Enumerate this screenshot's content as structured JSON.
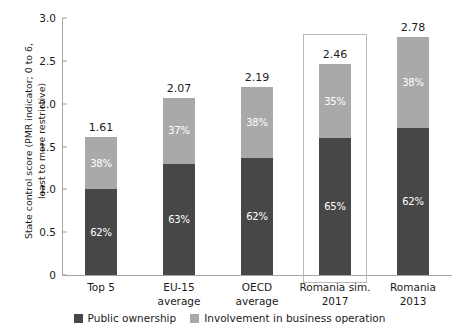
{
  "chart_data": {
    "type": "bar",
    "title": "",
    "subtitle": "",
    "stacked": true,
    "xlabel": "",
    "ylabel": "State control score (PMR indicator; 0 to 6,\nleast to more restrictive)",
    "ylim": [
      0,
      3.0
    ],
    "yticks": [
      "0",
      "0.5",
      "1.0",
      "1.5",
      "2.0",
      "2.5",
      "3.0"
    ],
    "ytick_values": [
      0,
      0.5,
      1.0,
      1.5,
      2.0,
      2.5,
      3.0
    ],
    "grid": false,
    "legend_position": "bottom",
    "categories": [
      "Top 5",
      "EU-15\naverage",
      "OECD\naverage",
      "Romania sim.\n2017",
      "Romania\n2013"
    ],
    "series": [
      {
        "name": "Public ownership",
        "color": "#474747",
        "values": [
          1.0,
          1.3,
          1.36,
          1.6,
          1.72
        ],
        "labels": [
          "62%",
          "63%",
          "62%",
          "65%",
          "62%"
        ]
      },
      {
        "name": "Involvement in business operation",
        "color": "#a9a9a9",
        "values": [
          0.61,
          0.77,
          0.83,
          0.86,
          1.06
        ],
        "labels": [
          "38%",
          "37%",
          "38%",
          "35%",
          "38%"
        ]
      }
    ],
    "totals": [
      "1.61",
      "2.07",
      "2.19",
      "2.46",
      "2.78"
    ],
    "total_values": [
      1.61,
      2.07,
      2.19,
      2.46,
      2.78
    ],
    "highlighted_category": "Romania sim.\n2017",
    "annotations": []
  },
  "legend": {
    "items": [
      {
        "label": "Public ownership",
        "color": "#474747"
      },
      {
        "label": "Involvement in business operation",
        "color": "#a9a9a9"
      }
    ]
  },
  "axis": {
    "y_title": "State control score (PMR indicator; 0 to 6,\nleast to more restrictive)",
    "y_ticks": [
      "3.0",
      "2.5",
      "2.0",
      "1.5",
      "1.0",
      "0.5",
      "0"
    ]
  },
  "bars": [
    {
      "category": "Top 5",
      "total": "1.61",
      "dark_pct": "62%",
      "light_pct": "38%"
    },
    {
      "category": "EU-15\naverage",
      "total": "2.07",
      "dark_pct": "63%",
      "light_pct": "37%"
    },
    {
      "category": "OECD\naverage",
      "total": "2.19",
      "dark_pct": "62%",
      "light_pct": "38%"
    },
    {
      "category": "Romania sim.\n2017",
      "total": "2.46",
      "dark_pct": "65%",
      "light_pct": "35%"
    },
    {
      "category": "Romania\n2013",
      "total": "2.78",
      "dark_pct": "62%",
      "light_pct": "38%"
    }
  ]
}
